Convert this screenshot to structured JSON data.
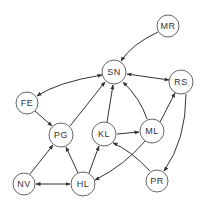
{
  "diagram": {
    "type": "directed-graph",
    "nodes": [
      {
        "id": "MR",
        "label": "MR",
        "x": 168,
        "y": 26,
        "r": 11
      },
      {
        "id": "SN",
        "label": "SN",
        "x": 114,
        "y": 72,
        "r": 12
      },
      {
        "id": "RS",
        "label": "RS",
        "x": 181,
        "y": 82,
        "r": 12
      },
      {
        "id": "FE",
        "label": "FE",
        "x": 27,
        "y": 103,
        "r": 11
      },
      {
        "id": "PG",
        "label": "PG",
        "x": 61,
        "y": 135,
        "r": 12
      },
      {
        "id": "KL",
        "label": "KL",
        "x": 104,
        "y": 134,
        "r": 12
      },
      {
        "id": "ML",
        "label": "ML",
        "x": 152,
        "y": 131,
        "r": 12
      },
      {
        "id": "NV",
        "label": "NV",
        "x": 24,
        "y": 184,
        "r": 11
      },
      {
        "id": "HL",
        "label": "HL",
        "x": 83,
        "y": 184,
        "r": 12
      },
      {
        "id": "PR",
        "label": "PR",
        "x": 157,
        "y": 181,
        "r": 11
      }
    ],
    "edges": [
      {
        "from": "MR",
        "to": "SN",
        "bidirectional": false,
        "curved": true
      },
      {
        "from": "SN",
        "to": "FE",
        "bidirectional": true,
        "curved": true
      },
      {
        "from": "SN",
        "to": "RS",
        "bidirectional": true,
        "curved": false
      },
      {
        "from": "FE",
        "to": "PG",
        "bidirectional": false,
        "curved": false
      },
      {
        "from": "PG",
        "to": "SN",
        "bidirectional": false,
        "curved": false
      },
      {
        "from": "KL",
        "to": "SN",
        "bidirectional": false,
        "curved": false
      },
      {
        "from": "ML",
        "to": "SN",
        "bidirectional": false,
        "curved": true
      },
      {
        "from": "ML",
        "to": "RS",
        "bidirectional": false,
        "curved": false
      },
      {
        "from": "KL",
        "to": "ML",
        "bidirectional": false,
        "curved": false
      },
      {
        "from": "RS",
        "to": "PR",
        "bidirectional": false,
        "curved": true
      },
      {
        "from": "PR",
        "to": "KL",
        "bidirectional": false,
        "curved": true
      },
      {
        "from": "ML",
        "to": "HL",
        "bidirectional": false,
        "curved": true
      },
      {
        "from": "HL",
        "to": "KL",
        "bidirectional": false,
        "curved": false
      },
      {
        "from": "HL",
        "to": "PG",
        "bidirectional": false,
        "curved": false
      },
      {
        "from": "NV",
        "to": "PG",
        "bidirectional": false,
        "curved": false
      },
      {
        "from": "NV",
        "to": "HL",
        "bidirectional": true,
        "curved": false
      }
    ]
  },
  "labels": {
    "MR": "MR",
    "SN": "SN",
    "RS": "RS",
    "FE": "FE",
    "PG": "PG",
    "KL": "KL",
    "ML": "ML",
    "NV": "NV",
    "HL": "HL",
    "PR": "PR"
  },
  "colors": {
    "stroke": "#333333",
    "node_border": "#555555",
    "background": "#ffffff"
  }
}
